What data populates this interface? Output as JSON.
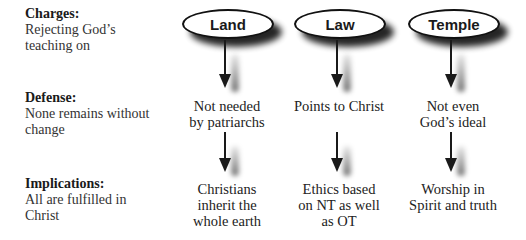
{
  "rows": {
    "charges": {
      "heading": "Charges:",
      "line1": "Rejecting God’s",
      "line2": "teaching on"
    },
    "defense": {
      "heading": "Defense:",
      "line1": "None remains without",
      "line2": "change"
    },
    "implications": {
      "heading": "Implications:",
      "line1": "All are fulfilled in",
      "line2": "Christ"
    }
  },
  "columns": [
    {
      "topic": "Land",
      "defense": [
        "Not needed",
        "by patriarchs"
      ],
      "implication": [
        "Christians",
        "inherit the",
        "whole earth"
      ]
    },
    {
      "topic": "Law",
      "defense": [
        "Points to Christ"
      ],
      "implication": [
        "Ethics based",
        "on NT as well",
        "as OT"
      ]
    },
    {
      "topic": "Temple",
      "defense": [
        "Not even",
        "God’s ideal"
      ],
      "implication": [
        "Worship in",
        "Spirit and truth"
      ]
    }
  ],
  "icons": {
    "arrow": "down-arrow-icon",
    "node": "ellipse-node"
  },
  "colors": {
    "ink": "#1a1a1a",
    "background": "#ffffff",
    "shadow": "#000000"
  }
}
